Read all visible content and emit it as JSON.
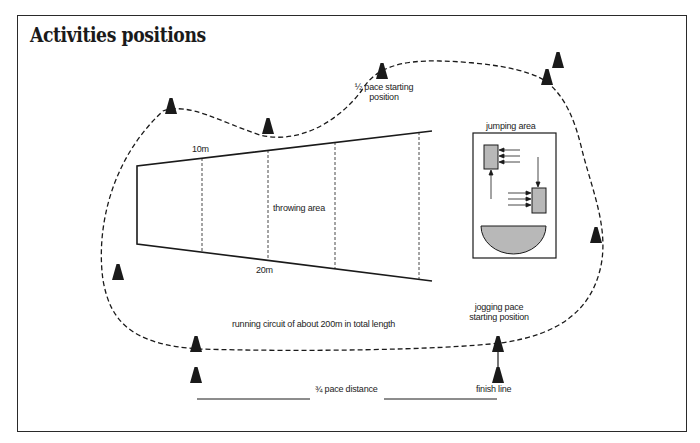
{
  "title": "Activities positions",
  "labels": {
    "half_pace": [
      "½ pace starting",
      "position"
    ],
    "ten_m": "10m",
    "twenty_m": "20m",
    "throwing_area": "throwing area",
    "jumping_area": "jumping area",
    "running_circuit": "running circuit of about 200m in total length",
    "jogging_pace": [
      "jogging pace",
      "starting position"
    ],
    "three_quarter_pace": "¾ pace distance",
    "finish_line": "finish line"
  },
  "colors": {
    "ink": "#1a1a1a",
    "fill_gray": "#b8b8b8",
    "background": "#ffffff"
  },
  "cones": [
    {
      "name": "cone-top-left",
      "x": 171,
      "y": 107
    },
    {
      "name": "cone-top-mid",
      "x": 268,
      "y": 127
    },
    {
      "name": "cone-half-pace",
      "x": 382,
      "y": 72
    },
    {
      "name": "cone-top-right-upper",
      "x": 558,
      "y": 61
    },
    {
      "name": "cone-top-right-lower",
      "x": 547,
      "y": 78
    },
    {
      "name": "cone-right",
      "x": 596,
      "y": 236
    },
    {
      "name": "cone-left",
      "x": 118,
      "y": 273
    },
    {
      "name": "cone-bottom-left-upper",
      "x": 196,
      "y": 345
    },
    {
      "name": "cone-bottom-left-lower",
      "x": 196,
      "y": 376
    },
    {
      "name": "cone-jogging-start",
      "x": 498,
      "y": 345
    },
    {
      "name": "cone-finish",
      "x": 498,
      "y": 376
    }
  ]
}
